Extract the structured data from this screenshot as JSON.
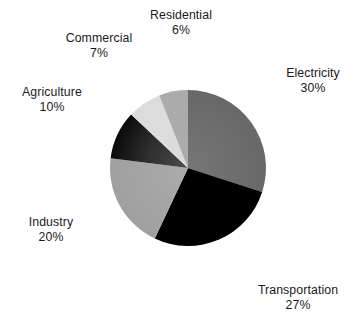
{
  "chart_data": {
    "type": "pie",
    "title": "",
    "subtitle": "",
    "xlabel": "",
    "ylabel": "",
    "legend_position": "none",
    "grid": false,
    "label_format": "name + percent",
    "start_angle_deg": 0,
    "direction": "clockwise",
    "categories": [
      "Electricity",
      "Transportation",
      "Industry",
      "Agriculture",
      "Commercial",
      "Residential"
    ],
    "values": [
      30,
      27,
      20,
      10,
      7,
      6
    ],
    "unit": "%",
    "slices": [
      {
        "name": "Electricity",
        "value": 30,
        "value_label": "30%",
        "color": "#6e6e6e"
      },
      {
        "name": "Transportation",
        "value": 27,
        "value_label": "27%",
        "color": "#000000"
      },
      {
        "name": "Industry",
        "value": 20,
        "value_label": "20%",
        "color": "#a6a6a6"
      },
      {
        "name": "Agriculture",
        "value": 10,
        "value_label": "10%",
        "color": "#2b2b2b"
      },
      {
        "name": "Commercial",
        "value": 7,
        "value_label": "7%",
        "color": "#dcdcdc"
      },
      {
        "name": "Residential",
        "value": 6,
        "value_label": "6%",
        "color": "#ababab"
      }
    ],
    "background_color": "#ffffff",
    "text_color": "#1a1a1a"
  },
  "labels": {
    "electricity": {
      "name": "Electricity",
      "value": "30%"
    },
    "transportation": {
      "name": "Transportation",
      "value": "27%"
    },
    "industry": {
      "name": "Industry",
      "value": "20%"
    },
    "agriculture": {
      "name": "Agriculture",
      "value": "10%"
    },
    "commercial": {
      "name": "Commercial",
      "value": "7%"
    },
    "residential": {
      "name": "Residential",
      "value": "6%"
    }
  }
}
